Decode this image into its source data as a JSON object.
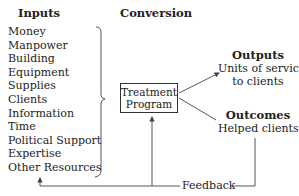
{
  "headings": {
    "inputs": "Inputs",
    "conversion": "Conversion",
    "outputs": "Outputs",
    "outcomes": "Outcomes"
  },
  "inputs": {
    "items": [
      "Money",
      "Manpower",
      "Building",
      "Equipment",
      "Supplies",
      "Clients",
      "Information",
      "Time",
      "Political Support",
      "Expertise",
      "Other Resources"
    ]
  },
  "program": {
    "line1": "Treatment",
    "line2": "Program"
  },
  "outputs": {
    "line1": "Units of service",
    "line2": "to clients"
  },
  "outcomes": {
    "line1": "Helped clients"
  },
  "feedback": {
    "label": "Feedback"
  },
  "colors": {
    "line": "#444444",
    "text": "#222222"
  }
}
